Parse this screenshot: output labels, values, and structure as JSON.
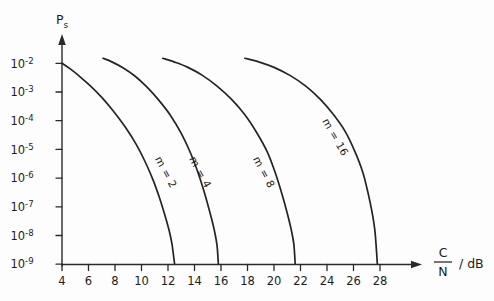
{
  "chart": {
    "type": "line",
    "title": "",
    "ylabel": "Ps",
    "ylabel_base": "P",
    "ylabel_sub": "s",
    "xlabel": "C/N / dB",
    "xlabel_numerator": "C",
    "xlabel_denominator": "N",
    "xlabel_units": "/ dB",
    "background_color": "#fdfdfd",
    "line_color": "#242424",
    "axis_color": "#2a2a2a",
    "grid": false,
    "legend_position": "inline-curve-labels"
  },
  "chart_data": {
    "type": "line",
    "title": "",
    "xlabel": "C/N / dB",
    "ylabel": "Ps",
    "xlim": [
      4,
      28
    ],
    "ylim": [
      1e-09,
      0.01
    ],
    "yscale": "log",
    "xticks": [
      4,
      6,
      8,
      10,
      12,
      14,
      16,
      18,
      20,
      22,
      24,
      26,
      28
    ],
    "xticklabels": [
      "4",
      "6",
      "8",
      "10",
      "12",
      "14",
      "16",
      "18",
      "20",
      "22",
      "24",
      "26",
      "28"
    ],
    "yticks": [
      0.01,
      0.001,
      0.0001,
      1e-05,
      1e-06,
      1e-07,
      1e-08,
      1e-09
    ],
    "yticklabels": [
      "10-2",
      "10-3",
      "10-4",
      "10-5",
      "10-6",
      "10-7",
      "10-8",
      "10-9"
    ],
    "yticklabels_base": "10",
    "yticklabels_exponents": [
      "-2",
      "-3",
      "-4",
      "-5",
      "-6",
      "-7",
      "-8",
      "-9"
    ],
    "grid": false,
    "legend_position": "inline",
    "series": [
      {
        "name": "m = 2",
        "label": "m = 2",
        "label_x": 11.6,
        "label_y": 1.4e-06,
        "label_rotation": 62,
        "x": [
          4.0,
          4.6,
          5.3,
          6.1,
          7.0,
          7.9,
          8.8,
          9.6,
          10.3,
          10.9,
          11.4,
          11.8,
          12.1,
          12.3,
          12.5
        ],
        "y": [
          0.01,
          0.0065,
          0.0036,
          0.0017,
          0.00065,
          0.00021,
          5.8e-05,
          1.5e-05,
          3.5e-06,
          8e-07,
          1.8e-07,
          4.5e-08,
          1.4e-08,
          5e-09,
          1e-09
        ]
      },
      {
        "name": "m = 4",
        "label": "m = 4",
        "label_x": 14.2,
        "label_y": 1.4e-06,
        "label_rotation": 62,
        "x": [
          7.1,
          7.8,
          8.6,
          9.5,
          10.4,
          11.3,
          12.2,
          13.0,
          13.7,
          14.3,
          14.8,
          15.2,
          15.5,
          15.7,
          15.8
        ],
        "y": [
          0.015,
          0.011,
          0.007,
          0.0036,
          0.0015,
          0.00052,
          0.00015,
          3.6e-05,
          7.5e-06,
          1.4e-06,
          2.6e-07,
          5.5e-08,
          1.5e-08,
          4.5e-09,
          1e-09
        ]
      },
      {
        "name": "m = 8",
        "label": "m = 8",
        "label_x": 19.0,
        "label_y": 1.4e-06,
        "label_rotation": 62,
        "x": [
          11.6,
          12.5,
          13.5,
          14.6,
          15.7,
          16.8,
          17.8,
          18.7,
          19.5,
          20.1,
          20.6,
          21.0,
          21.3,
          21.5,
          21.6
        ],
        "y": [
          0.015,
          0.011,
          0.0072,
          0.0038,
          0.0016,
          0.00055,
          0.00016,
          3.8e-05,
          8e-06,
          1.5e-06,
          2.8e-07,
          6e-08,
          1.6e-08,
          4.8e-09,
          1e-09
        ]
      },
      {
        "name": "m = 16",
        "label": "m = 16",
        "label_x": 24.4,
        "label_y": 2.3e-05,
        "label_rotation": 60,
        "x": [
          17.8,
          18.9,
          20.0,
          21.2,
          22.4,
          23.5,
          24.5,
          25.4,
          26.1,
          26.7,
          27.1,
          27.4,
          27.6,
          27.7,
          27.8
        ],
        "y": [
          0.015,
          0.011,
          0.0072,
          0.0038,
          0.0016,
          0.00055,
          0.00016,
          4e-05,
          8.5e-06,
          1.6e-06,
          3e-07,
          6.5e-08,
          1.7e-08,
          5e-09,
          1e-09
        ]
      }
    ]
  }
}
